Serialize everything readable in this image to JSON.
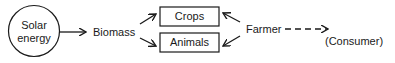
{
  "diagram": {
    "nodes": {
      "solar_energy": {
        "line1": "Solar",
        "line2": "energy",
        "shape": "circle"
      },
      "biomass": {
        "label": "Biomass"
      },
      "crops": {
        "label": "Crops",
        "shape": "box"
      },
      "animals": {
        "label": "Animals",
        "shape": "box"
      },
      "farmer": {
        "label": "Farmer"
      },
      "consumer": {
        "label": "(Consumer)"
      }
    },
    "edges": [
      {
        "from": "Solar energy",
        "to": "Biomass",
        "style": "solid"
      },
      {
        "from": "Biomass",
        "to": "Crops",
        "style": "solid"
      },
      {
        "from": "Biomass",
        "to": "Animals",
        "style": "solid"
      },
      {
        "from": "Farmer",
        "to": "Crops",
        "style": "solid"
      },
      {
        "from": "Farmer",
        "to": "Animals",
        "style": "solid"
      },
      {
        "from": "Farmer",
        "to": "Consumer",
        "style": "dashed"
      }
    ],
    "colors": {
      "stroke": "#1a1a1a",
      "background": "#ffffff"
    }
  }
}
